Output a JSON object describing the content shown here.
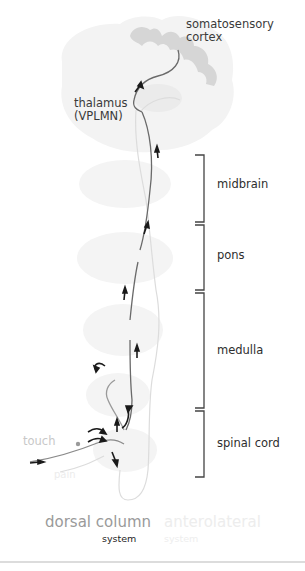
{
  "labels": {
    "cortex": [
      "somatosensory",
      "cortex"
    ],
    "thalamus": [
      "thalamus",
      "(VPLMN)"
    ],
    "touch": "touch",
    "pain": "pain"
  },
  "regions": [
    {
      "label": "midbrain"
    },
    {
      "label": "pons"
    },
    {
      "label": "medulla"
    },
    {
      "label": "spinal cord"
    }
  ],
  "legend": {
    "dorsal": {
      "title": "dorsal column",
      "subtitle": "system"
    },
    "anterolateral": {
      "title": "anterolateral",
      "subtitle": "system"
    }
  },
  "colors": {
    "tissue": "#f2f2f2",
    "cortex_gray": "#d6d6d6",
    "pathway_dark": "#666666",
    "pathway_light": "#d0d0d0",
    "arrow": "#1a1a1a",
    "bracket": "#444444"
  }
}
